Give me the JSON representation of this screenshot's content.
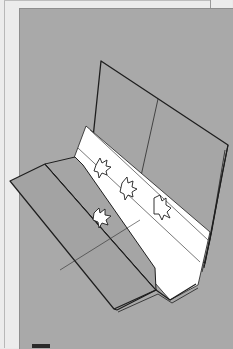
{
  "figure": {
    "colors": {
      "page": "#ececec",
      "panel": "#a9a9a9",
      "paper": "#a4a4a4",
      "strip": "#ffffff",
      "outline": "#1e1e1e"
    },
    "icons": [
      "maple-leaf-icon",
      "maple-leaf-icon",
      "maple-leaf-icon",
      "maple-leaf-icon"
    ]
  }
}
